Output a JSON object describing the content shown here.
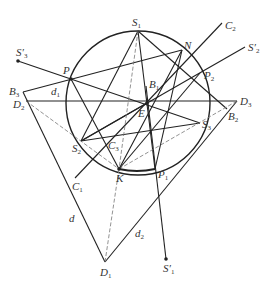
{
  "diagram": {
    "type": "geometry",
    "circle": {
      "cx": 138,
      "cy": 103,
      "r": 72
    },
    "points": {
      "S1": [
        138,
        31
      ],
      "N": [
        182,
        50
      ],
      "P": [
        71,
        79
      ],
      "P2": [
        200,
        73
      ],
      "B1": [
        146,
        86
      ],
      "E": [
        147,
        103
      ],
      "S3": [
        200,
        123
      ],
      "S2": [
        81,
        141
      ],
      "K": [
        119,
        169
      ],
      "P1": [
        155,
        169
      ],
      "B3": [
        23,
        92
      ],
      "D2": [
        26,
        101
      ],
      "D3": [
        237,
        101
      ],
      "B2": [
        227,
        109
      ],
      "D1": [
        105,
        262
      ],
      "S3p": [
        18,
        61
      ],
      "S2p": [
        245,
        47
      ],
      "S1p": [
        166,
        259
      ],
      "C1": [
        75,
        178
      ],
      "C2": [
        222,
        23
      ]
    },
    "labels": [
      {
        "id": "S1",
        "base": "S",
        "sub": "1",
        "prime": "",
        "x": 132,
        "y": 17
      },
      {
        "id": "C2",
        "base": "C",
        "sub": "2",
        "prime": "",
        "x": 225,
        "y": 20
      },
      {
        "id": "N",
        "base": "N",
        "sub": "",
        "prime": "",
        "x": 184,
        "y": 40
      },
      {
        "id": "S3p",
        "base": "S",
        "sub": "3",
        "prime": "′",
        "x": 16,
        "y": 47
      },
      {
        "id": "S2p",
        "base": "S",
        "sub": "2",
        "prime": "′",
        "x": 248,
        "y": 42
      },
      {
        "id": "P",
        "base": "P",
        "sub": "",
        "prime": "",
        "x": 63,
        "y": 65
      },
      {
        "id": "P2",
        "base": "P",
        "sub": "2",
        "prime": "",
        "x": 204,
        "y": 70
      },
      {
        "id": "B1",
        "base": "B",
        "sub": "1",
        "prime": "",
        "x": 149,
        "y": 79
      },
      {
        "id": "B3",
        "base": "B",
        "sub": "3",
        "prime": "",
        "x": 9,
        "y": 86
      },
      {
        "id": "d1",
        "base": "d",
        "sub": "1",
        "prime": "",
        "x": 51,
        "y": 86
      },
      {
        "id": "D2",
        "base": "D",
        "sub": "2",
        "prime": "",
        "x": 13,
        "y": 99
      },
      {
        "id": "D3",
        "base": "D",
        "sub": "3",
        "prime": "",
        "x": 240,
        "y": 96
      },
      {
        "id": "E",
        "base": "E",
        "sub": "",
        "prime": "",
        "x": 138,
        "y": 108
      },
      {
        "id": "B2",
        "base": "B",
        "sub": "2",
        "prime": "",
        "x": 228,
        "y": 111
      },
      {
        "id": "S3",
        "base": "S",
        "sub": "3",
        "prime": "",
        "x": 202,
        "y": 119
      },
      {
        "id": "C3",
        "base": "C",
        "sub": "3",
        "prime": "",
        "x": 108,
        "y": 140
      },
      {
        "id": "S2",
        "base": "S",
        "sub": "2",
        "prime": "",
        "x": 72,
        "y": 143
      },
      {
        "id": "K",
        "base": "K",
        "sub": "",
        "prime": "",
        "x": 116,
        "y": 173
      },
      {
        "id": "P1",
        "base": "P",
        "sub": "1",
        "prime": "",
        "x": 158,
        "y": 169
      },
      {
        "id": "C1",
        "base": "C",
        "sub": "1",
        "prime": "",
        "x": 72,
        "y": 181
      },
      {
        "id": "d",
        "base": "d",
        "sub": "",
        "prime": "",
        "x": 69,
        "y": 213
      },
      {
        "id": "d2",
        "base": "d",
        "sub": "2",
        "prime": "",
        "x": 135,
        "y": 228
      },
      {
        "id": "D1",
        "base": "D",
        "sub": "1",
        "prime": "",
        "x": 100,
        "y": 267
      },
      {
        "id": "S1p",
        "base": "S",
        "sub": "1",
        "prime": "′",
        "x": 163,
        "y": 263
      }
    ],
    "solid_lines": [
      [
        18,
        61,
        200,
        123
      ],
      [
        23,
        92,
        182,
        50
      ],
      [
        26,
        101,
        237,
        101
      ],
      [
        23,
        92,
        105,
        262
      ],
      [
        105,
        262,
        237,
        101
      ],
      [
        75,
        178,
        222,
        23
      ],
      [
        245,
        47,
        81,
        141
      ],
      [
        138,
        31,
        81,
        141
      ],
      [
        138,
        31,
        227,
        109
      ],
      [
        138,
        31,
        155,
        169
      ],
      [
        71,
        79,
        119,
        169
      ],
      [
        182,
        50,
        119,
        169
      ],
      [
        200,
        73,
        119,
        169
      ],
      [
        81,
        141,
        200,
        123
      ],
      [
        166,
        259,
        146,
        86
      ],
      [
        182,
        50,
        155,
        169
      ],
      [
        81,
        141,
        147,
        103
      ]
    ],
    "dashed_lines": [
      [
        138,
        31,
        119,
        169
      ],
      [
        26,
        101,
        119,
        169
      ],
      [
        119,
        169,
        237,
        101
      ],
      [
        119,
        169,
        105,
        262
      ]
    ],
    "dots": [
      "S3p",
      "S1p",
      "P",
      "K",
      "E"
    ]
  }
}
